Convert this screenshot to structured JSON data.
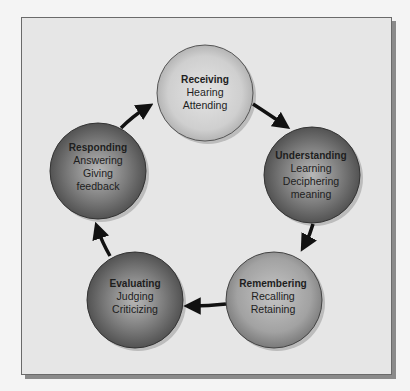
{
  "diagram": {
    "type": "cycle",
    "colors": {
      "background": "#e6e6e6",
      "frame_border": "#6a6a6a",
      "shadow": "#8a8a8a",
      "arrow": "#111111",
      "text": "#1e1e1e"
    },
    "nodes": [
      {
        "id": "receiving",
        "title": "Receiving",
        "lines": [
          "Hearing",
          "Attending"
        ],
        "shade": "light"
      },
      {
        "id": "understanding",
        "title": "Understanding",
        "lines": [
          "Learning",
          "Deciphering",
          "meaning"
        ],
        "shade": "dark"
      },
      {
        "id": "remembering",
        "title": "Remembering",
        "lines": [
          "Recalling",
          "Retaining"
        ],
        "shade": "medium"
      },
      {
        "id": "evaluating",
        "title": "Evaluating",
        "lines": [
          "Judging",
          "Criticizing"
        ],
        "shade": "dark"
      },
      {
        "id": "responding",
        "title": "Responding",
        "lines": [
          "Answering",
          "Giving",
          "feedback"
        ],
        "shade": "dark"
      }
    ],
    "edges": [
      {
        "from": "receiving",
        "to": "understanding"
      },
      {
        "from": "understanding",
        "to": "remembering"
      },
      {
        "from": "remembering",
        "to": "evaluating"
      },
      {
        "from": "evaluating",
        "to": "responding"
      },
      {
        "from": "responding",
        "to": "receiving"
      }
    ]
  }
}
